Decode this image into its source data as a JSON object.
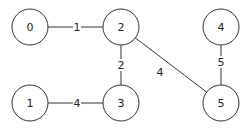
{
  "graph": {
    "nodes": [
      {
        "id": "0",
        "label": "0",
        "x": 30,
        "y": 27
      },
      {
        "id": "1",
        "label": "1",
        "x": 30,
        "y": 103
      },
      {
        "id": "2",
        "label": "2",
        "x": 121,
        "y": 27
      },
      {
        "id": "3",
        "label": "3",
        "x": 121,
        "y": 103
      },
      {
        "id": "4",
        "label": "4",
        "x": 221,
        "y": 27
      },
      {
        "id": "5",
        "label": "5",
        "x": 221,
        "y": 103
      }
    ],
    "edges": [
      {
        "from": "0",
        "to": "2",
        "weight": "1",
        "label_x": 77,
        "label_y": 27
      },
      {
        "from": "2",
        "to": "3",
        "weight": "2",
        "label_x": 121,
        "label_y": 65
      },
      {
        "from": "2",
        "to": "5",
        "weight": "4",
        "label_x": 160,
        "label_y": 72
      },
      {
        "from": "4",
        "to": "5",
        "weight": "5",
        "label_x": 221,
        "label_y": 62
      },
      {
        "from": "1",
        "to": "3",
        "weight": "4",
        "label_x": 77,
        "label_y": 103
      }
    ],
    "node_radius": 18
  }
}
